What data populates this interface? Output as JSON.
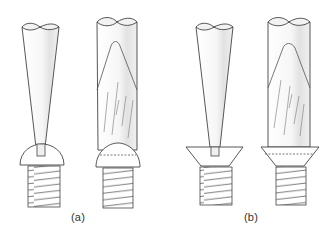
{
  "figure": {
    "panels": [
      {
        "id": "a",
        "label": "(a)",
        "screw_head": "round-head",
        "items": [
          "tapered-screwdriver-in-slot",
          "flared-screwdriver-over-head"
        ]
      },
      {
        "id": "b",
        "label": "(b)",
        "screw_head": "countersunk-head",
        "items": [
          "tapered-screwdriver-in-slot",
          "flared-screwdriver-over-head"
        ]
      }
    ]
  },
  "colors": {
    "line": "#444444",
    "fill": "#ffffff",
    "shade": "#e4e4e4"
  }
}
